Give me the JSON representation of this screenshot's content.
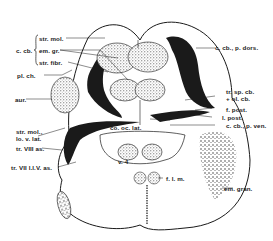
{
  "figure": {
    "type": "anatomical cross-section diagram",
    "colors": {
      "ink": "#1a1a1a",
      "background": "#ffffff",
      "stipple": "#6b6b6b"
    }
  },
  "labels": {
    "c_cb": "c. cb.",
    "str_mol": "str. mol.",
    "em_gr": "em. gr.",
    "str_fibr": "str. fibr.",
    "pl_ch": "pl. ch.",
    "aur": "aur.",
    "str_mol_lo_v_lat_1": "str. mol.,",
    "str_mol_lo_v_lat_2": "lo. v. lat.",
    "tr_viii_as": "tr. VIII as.",
    "tr_vii_l_i_v_as": "tr. VII l.l.V. as.",
    "c_cb_p_dors": "c. cb., p. dors.",
    "tr_sp_cb_1": "tr. sp. cb.",
    "tr_sp_cb_2": "+ ol. cb.",
    "f_post": "f. post.",
    "l_post": "l. post.",
    "c_cb_p_ven": "c. cb., p. ven.",
    "co_oc_lat": "co. oc. lat.",
    "v4": "v. 4",
    "f_l_m": "f. l. m.",
    "em_gran": "em. gran."
  }
}
